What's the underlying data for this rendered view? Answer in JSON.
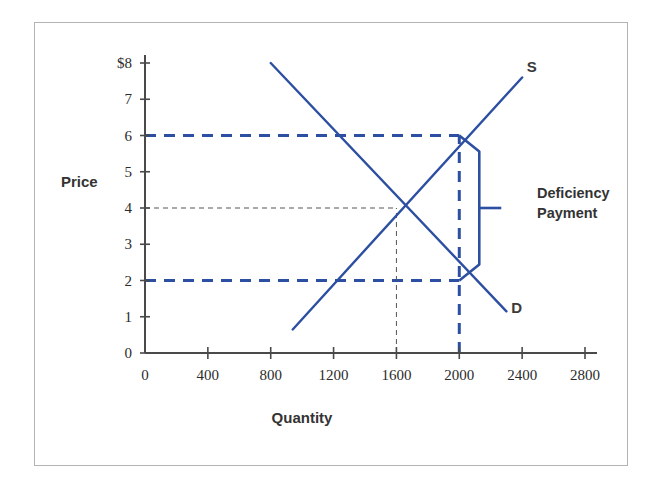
{
  "figure": {
    "name": "deficiency-payment-supply-demand-diagram",
    "frame_color": "#b4b4b4",
    "background": "#ffffff"
  },
  "chart_data": {
    "type": "line",
    "title": "",
    "subtitle": "",
    "xlabel": "Quantity",
    "ylabel": "Price",
    "xlim": [
      0,
      2800
    ],
    "ylim": [
      0,
      8
    ],
    "grid": false,
    "legend_position": "inline-curve-labels",
    "x_ticks": [
      0,
      400,
      800,
      1200,
      1600,
      2000,
      2400,
      2800
    ],
    "x_tick_labels": [
      "0",
      "400",
      "800",
      "1200",
      "1600",
      "2000",
      "2400",
      "2800"
    ],
    "y_ticks": [
      0,
      1,
      2,
      3,
      4,
      5,
      6,
      7,
      8
    ],
    "y_tick_labels": [
      "0",
      "1",
      "2",
      "3",
      "4",
      "5",
      "6",
      "7",
      "$8"
    ],
    "series": [
      {
        "name": "Supply",
        "label": "S",
        "color": "#2d4fa2",
        "style": "solid",
        "points": [
          [
            940,
            0.65
          ],
          [
            2400,
            7.6
          ]
        ],
        "label_point": [
          2430,
          7.75
        ]
      },
      {
        "name": "Demand",
        "label": "D",
        "color": "#2d4fa2",
        "style": "solid",
        "points": [
          [
            800,
            8.0
          ],
          [
            2300,
            1.15
          ]
        ],
        "label_point": [
          2330,
          1.1
        ]
      }
    ],
    "markers": [
      {
        "name": "support-price-point",
        "x": 2000,
        "y": 6
      },
      {
        "name": "market-clearing-point",
        "x": 2000,
        "y": 2
      },
      {
        "name": "equilibrium-point",
        "x": 1600,
        "y": 4
      }
    ],
    "guides": [
      {
        "name": "support-price-horizontal",
        "style": "dashed-blue",
        "from": [
          0,
          6
        ],
        "to": [
          2000,
          6
        ]
      },
      {
        "name": "market-price-horizontal",
        "style": "dashed-blue",
        "from": [
          0,
          2
        ],
        "to": [
          2000,
          2
        ]
      },
      {
        "name": "target-quantity-vertical",
        "style": "dashed-blue",
        "from": [
          2000,
          0
        ],
        "to": [
          2000,
          6
        ]
      },
      {
        "name": "equilibrium-price-horizontal",
        "style": "dashed-gray",
        "from": [
          0,
          4
        ],
        "to": [
          1600,
          4
        ]
      },
      {
        "name": "equilibrium-quantity-vertical",
        "style": "dashed-gray",
        "from": [
          1600,
          0
        ],
        "to": [
          1600,
          4
        ]
      }
    ],
    "annotations": [
      {
        "name": "deficiency-payment",
        "text_line1": "Deficiency",
        "text_line2": "Payment",
        "bracket_top": [
          2000,
          6
        ],
        "bracket_bottom": [
          2000,
          2
        ],
        "bracket_mid": [
          2000,
          4
        ],
        "value": 4,
        "color": "#2d4fa2"
      }
    ]
  },
  "labels": {
    "price_axis_title": "Price",
    "quantity_axis_title": "Quantity",
    "supply_curve": "S",
    "demand_curve": "D",
    "deficiency_line1": "Deficiency",
    "deficiency_line2": "Payment",
    "y_dollar_top": "$8"
  }
}
